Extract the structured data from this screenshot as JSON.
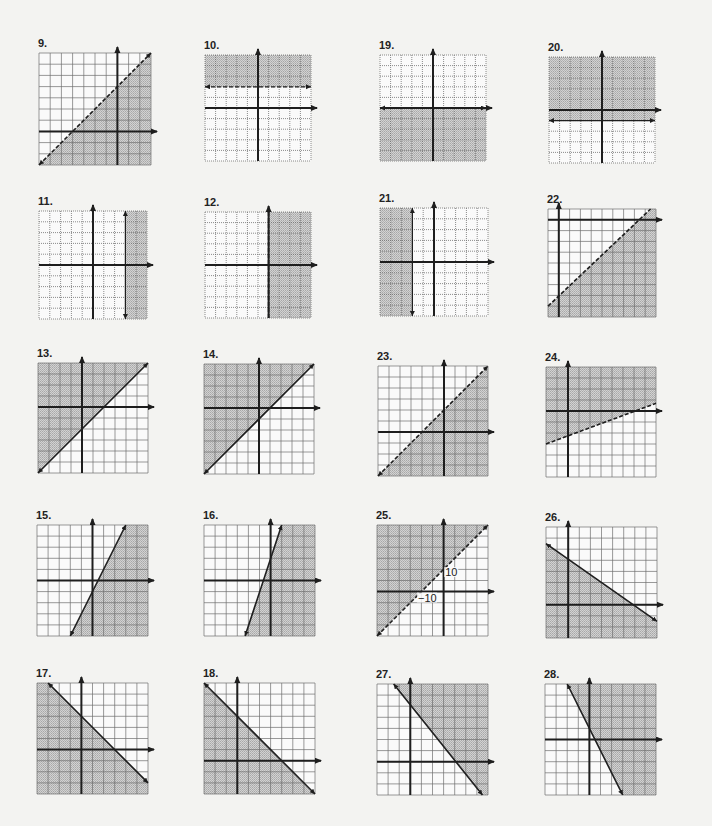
{
  "page": {
    "background": "#f3f3f1",
    "shade_color": "#c8c8c8",
    "grid_color": "#6e6e6e",
    "axis_color": "#1e1e1e"
  },
  "graphs": [
    {
      "label": "9.",
      "x": 39,
      "y": 53,
      "cells": 10,
      "cell": 11.2,
      "ax": 7,
      "ay": 7,
      "grid": "solid",
      "line": {
        "p1": [
          0,
          10
        ],
        "p2": [
          10,
          0
        ],
        "style": "dashed",
        "arrows": "both"
      },
      "shade": "below"
    },
    {
      "label": "10.",
      "x": 205,
      "y": 55,
      "cells": 10,
      "cell": 10.6,
      "ax": 5,
      "ay": 5,
      "grid": "dotted",
      "line": {
        "p1": [
          0,
          3
        ],
        "p2": [
          10,
          3
        ],
        "style": "dashed",
        "arrows": "both",
        "thin": true
      },
      "shade": "above"
    },
    {
      "label": "19.",
      "x": 380,
      "y": 55,
      "cells": 10,
      "cell": 10.6,
      "ax": 5,
      "ay": 5,
      "grid": "dotted",
      "line": {
        "p1": [
          0,
          5
        ],
        "p2": [
          10,
          5
        ],
        "style": "solid",
        "arrows": "both"
      },
      "shade": "below"
    },
    {
      "label": "20.",
      "x": 549,
      "y": 57,
      "cells": 10,
      "cell": 10.6,
      "ax": 5,
      "ay": 5,
      "grid": "dotted",
      "line": {
        "p1": [
          0,
          6
        ],
        "p2": [
          10,
          6
        ],
        "style": "solid",
        "arrows": "both",
        "thin": true
      },
      "shade": "above"
    },
    {
      "label": "11.",
      "x": 39,
      "y": 211,
      "cells": 10,
      "cell": 10.8,
      "ax": 5,
      "ay": 5,
      "grid": "dotted",
      "line": {
        "p1": [
          8,
          0
        ],
        "p2": [
          8,
          10
        ],
        "style": "solid",
        "arrows": "both",
        "thin": true
      },
      "shade": "right"
    },
    {
      "label": "12.",
      "x": 205,
      "y": 212,
      "cells": 10,
      "cell": 10.6,
      "ax": 6,
      "ay": 5,
      "grid": "dotted",
      "line": {
        "p1": [
          6,
          0
        ],
        "p2": [
          6,
          10
        ],
        "style": "dashed",
        "arrows": "none"
      },
      "shade": "right"
    },
    {
      "label": "21.",
      "x": 380,
      "y": 208,
      "cells": 10,
      "cell": 10.8,
      "ax": 5,
      "ay": 5,
      "grid": "dotted",
      "line": {
        "p1": [
          3,
          0
        ],
        "p2": [
          3,
          10
        ],
        "style": "solid",
        "arrows": "both",
        "thin": true
      },
      "shade": "left"
    },
    {
      "label": "22.",
      "x": 548,
      "y": 209,
      "cells": 10,
      "cell": 10.8,
      "ax": 1,
      "ay": 1,
      "grid": "solid",
      "line": {
        "p1": [
          0,
          9
        ],
        "p2": [
          9.5,
          0
        ],
        "style": "dashed",
        "arrows": "none"
      },
      "shade": "below"
    },
    {
      "label": "13.",
      "x": 38,
      "y": 363,
      "cells": 10,
      "cell": 11.0,
      "ax": 4,
      "ay": 4,
      "grid": "solid",
      "line": {
        "p1": [
          0,
          10
        ],
        "p2": [
          10,
          0
        ],
        "style": "solid",
        "arrows": "both"
      },
      "shade": "above"
    },
    {
      "label": "14.",
      "x": 204,
      "y": 364,
      "cells": 10,
      "cell": 11.0,
      "ax": 5,
      "ay": 4,
      "grid": "solid",
      "line": {
        "p1": [
          0,
          10
        ],
        "p2": [
          10,
          0
        ],
        "style": "solid",
        "arrows": "both"
      },
      "shade": "above"
    },
    {
      "label": "23.",
      "x": 378,
      "y": 366,
      "cells": 10,
      "cell": 11.0,
      "ax": 6,
      "ay": 6,
      "grid": "solid",
      "line": {
        "p1": [
          0,
          10
        ],
        "p2": [
          10,
          0
        ],
        "style": "dashed",
        "arrows": "both"
      },
      "shade": "below"
    },
    {
      "label": "24.",
      "x": 546,
      "y": 367,
      "cells": 10,
      "cell": 11.0,
      "ax": 2,
      "ay": 4,
      "grid": "solid",
      "line": {
        "p1": [
          0,
          7
        ],
        "p2": [
          10,
          3.3
        ],
        "style": "dashed",
        "arrows": "none"
      },
      "shade": "above"
    },
    {
      "label": "15.",
      "x": 37,
      "y": 525,
      "cells": 10,
      "cell": 11.1,
      "ax": 5,
      "ay": 5,
      "grid": "solid",
      "line": {
        "p1": [
          3,
          10
        ],
        "p2": [
          8,
          0
        ],
        "style": "solid",
        "arrows": "both"
      },
      "shade": "right"
    },
    {
      "label": "16.",
      "x": 204,
      "y": 525,
      "cells": 10,
      "cell": 11.1,
      "ax": 6,
      "ay": 5,
      "grid": "solid",
      "line": {
        "p1": [
          3.7,
          10
        ],
        "p2": [
          7,
          0
        ],
        "style": "solid",
        "arrows": "both"
      },
      "shade": "right"
    },
    {
      "label": "25.",
      "x": 377,
      "y": 525,
      "cells": 10,
      "cell": 11.1,
      "ax": 6,
      "ay": 6,
      "grid": "solid",
      "line": {
        "p1": [
          0,
          10
        ],
        "p2": [
          10,
          0
        ],
        "style": "dashed",
        "arrows": "both"
      },
      "shade": "above",
      "annotations": [
        {
          "text": "10",
          "gx": 6.15,
          "gy": 4.6
        },
        {
          "text": "−10",
          "gx": 3.7,
          "gy": 6.9
        }
      ]
    },
    {
      "label": "26.",
      "x": 546,
      "y": 527,
      "cells": 10,
      "cell": 11.1,
      "ax": 2,
      "ay": 7,
      "grid": "solid",
      "line": {
        "p1": [
          0,
          1.5
        ],
        "p2": [
          10,
          8.5
        ],
        "style": "solid",
        "arrows": "both"
      },
      "shade": "below"
    },
    {
      "label": "17.",
      "x": 37,
      "y": 683,
      "cells": 10,
      "cell": 11.1,
      "ax": 4,
      "ay": 6,
      "grid": "solid",
      "line": {
        "p1": [
          1,
          0
        ],
        "p2": [
          10,
          9
        ],
        "style": "solid",
        "arrows": "both"
      },
      "shade": "below"
    },
    {
      "label": "18.",
      "x": 204,
      "y": 683,
      "cells": 10,
      "cell": 11.1,
      "ax": 3,
      "ay": 7,
      "grid": "solid",
      "line": {
        "p1": [
          0,
          0
        ],
        "p2": [
          10,
          10
        ],
        "style": "solid",
        "arrows": "both"
      },
      "shade": "below"
    },
    {
      "label": "27.",
      "x": 377,
      "y": 684,
      "cells": 10,
      "cell": 11.1,
      "ax": 3,
      "ay": 7,
      "grid": "solid",
      "line": {
        "p1": [
          1.5,
          0
        ],
        "p2": [
          9.5,
          10
        ],
        "style": "solid",
        "arrows": "both"
      },
      "shade": "above"
    },
    {
      "label": "28.",
      "x": 545,
      "y": 684,
      "cells": 10,
      "cell": 11.1,
      "ax": 4,
      "ay": 5,
      "grid": "solid",
      "line": {
        "p1": [
          2,
          0
        ],
        "p2": [
          7,
          10
        ],
        "style": "solid",
        "arrows": "both"
      },
      "shade": "right"
    }
  ]
}
